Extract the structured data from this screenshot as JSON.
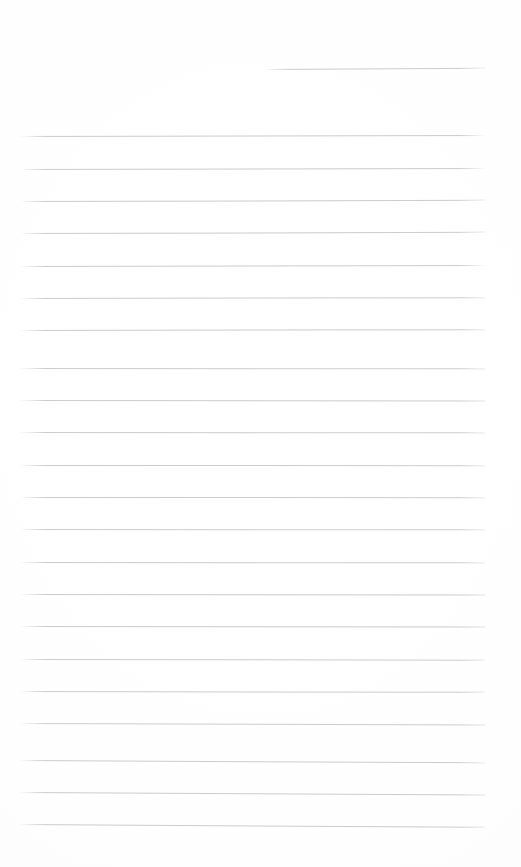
{
  "document": {
    "kind": "ruled-notebook-page",
    "title": "Blank Lined Notebook Page",
    "page_width": 521,
    "page_height": 867,
    "background_color": "#fefeff",
    "rule_color": "#c9c9ce",
    "rule_thickness_px": 1,
    "body_text": "",
    "header_text": "",
    "line_spacing_px": 32.3,
    "scan_skew_deg": -0.25,
    "rules": [
      {
        "name": "header-rule",
        "x": 265,
        "y": 69,
        "width": 220,
        "skew": -0.3
      },
      {
        "name": "body-rule-1",
        "x": 20,
        "y": 136,
        "width": 465,
        "skew": -0.12
      },
      {
        "name": "body-rule-2",
        "x": 20,
        "y": 169,
        "width": 465,
        "skew": -0.12
      },
      {
        "name": "body-rule-3",
        "x": 20,
        "y": 201,
        "width": 465,
        "skew": -0.14
      },
      {
        "name": "body-rule-4",
        "x": 20,
        "y": 233,
        "width": 465,
        "skew": -0.14
      },
      {
        "name": "body-rule-5",
        "x": 20,
        "y": 266,
        "width": 465,
        "skew": -0.12
      },
      {
        "name": "body-rule-6",
        "x": 20,
        "y": 298,
        "width": 465,
        "skew": -0.1
      },
      {
        "name": "body-rule-7",
        "x": 20,
        "y": 330,
        "width": 465,
        "skew": -0.1
      },
      {
        "name": "body-rule-8",
        "x": 20,
        "y": 368,
        "width": 465,
        "skew": 0.04
      },
      {
        "name": "body-rule-9",
        "x": 20,
        "y": 400,
        "width": 465,
        "skew": 0.06
      },
      {
        "name": "body-rule-10",
        "x": 20,
        "y": 432,
        "width": 465,
        "skew": 0.04
      },
      {
        "name": "body-rule-11",
        "x": 20,
        "y": 465,
        "width": 465,
        "skew": 0.02
      },
      {
        "name": "body-rule-12",
        "x": 20,
        "y": 497,
        "width": 465,
        "skew": 0.02
      },
      {
        "name": "body-rule-13",
        "x": 20,
        "y": 529,
        "width": 465,
        "skew": 0.04
      },
      {
        "name": "body-rule-14",
        "x": 20,
        "y": 562,
        "width": 465,
        "skew": 0.04
      },
      {
        "name": "body-rule-15",
        "x": 20,
        "y": 594,
        "width": 465,
        "skew": 0.06
      },
      {
        "name": "body-rule-16",
        "x": 20,
        "y": 626,
        "width": 465,
        "skew": 0.06
      },
      {
        "name": "body-rule-17",
        "x": 20,
        "y": 659,
        "width": 465,
        "skew": 0.08
      },
      {
        "name": "body-rule-18",
        "x": 20,
        "y": 691,
        "width": 465,
        "skew": 0.1
      },
      {
        "name": "body-rule-19",
        "x": 20,
        "y": 723,
        "width": 465,
        "skew": 0.2
      },
      {
        "name": "body-rule-20",
        "x": 20,
        "y": 760,
        "width": 465,
        "skew": 0.28
      },
      {
        "name": "body-rule-21",
        "x": 20,
        "y": 792,
        "width": 465,
        "skew": 0.3
      },
      {
        "name": "body-rule-22",
        "x": 20,
        "y": 824,
        "width": 465,
        "skew": 0.34
      }
    ]
  }
}
